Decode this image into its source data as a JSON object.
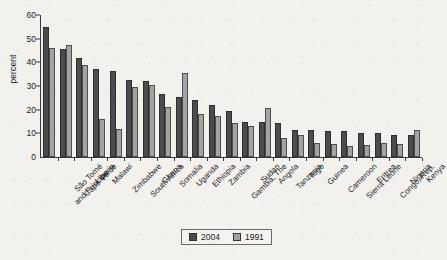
{
  "chart_data": {
    "type": "bar",
    "title": "",
    "xlabel": "",
    "ylabel": "percent",
    "ylim": [
      0,
      60
    ],
    "yticks": [
      0,
      10,
      20,
      30,
      40,
      50,
      60
    ],
    "grid": false,
    "legend_position": "bottom-center",
    "categories": [
      "São Tomé\nand Príncipe",
      "Cape Verde",
      "Liberia",
      "Malawi",
      "Zimbabwe",
      "South Africa",
      "Ghana",
      "Somalia",
      "Uganda",
      "Ethiopia",
      "Zambia",
      "Gambia, The",
      "Sudan",
      "Angola",
      "Tanzania",
      "Togo",
      "Guinea",
      "Cameroon",
      "Sierra Leone",
      "Eritrea",
      "Congo, Rep.",
      "Nigeria",
      "Kenya"
    ],
    "series": [
      {
        "name": "2004",
        "color": "#4c4c4c",
        "values": [
          55,
          45.5,
          42,
          37,
          36.5,
          32.5,
          32,
          26.5,
          25.5,
          24,
          22,
          19.5,
          15,
          15,
          14.5,
          11.5,
          11.5,
          11,
          11,
          10,
          10,
          9.5,
          9.5
        ]
      },
      {
        "name": "1991",
        "color": "#a3a3a3",
        "values": [
          46,
          47.5,
          39,
          16,
          12,
          29.5,
          30.5,
          21,
          35.5,
          18,
          17.5,
          14.5,
          13,
          20.5,
          8,
          9.5,
          6,
          5.5,
          4.5,
          5,
          6,
          5.5,
          11.5
        ]
      }
    ]
  },
  "legend": {
    "items": [
      {
        "label": "2004",
        "color": "#4c4c4c"
      },
      {
        "label": "1991",
        "color": "#a3a3a3"
      }
    ]
  }
}
